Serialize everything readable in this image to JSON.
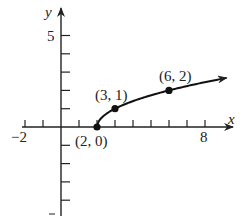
{
  "chart_data": {
    "type": "line",
    "title": "",
    "xlabel": "x",
    "ylabel": "y",
    "function": "y = sqrt(x - 2)",
    "x_tick_labels": [
      "-2",
      "8"
    ],
    "y_tick_labels": [
      "5"
    ],
    "xlim": [
      -3.5,
      9.5
    ],
    "ylim": [
      -4.8,
      6.2
    ],
    "grid": false,
    "legend": "none",
    "series": [
      {
        "name": "sqrt(x-2)",
        "x": [
          2,
          2.25,
          3,
          4,
          5,
          6,
          7,
          8,
          9.2
        ],
        "y": [
          0,
          0.5,
          1,
          1.414,
          1.732,
          2,
          2.236,
          2.449,
          2.683
        ]
      }
    ],
    "labeled_points": [
      {
        "label": "(2, 0)",
        "x": 2,
        "y": 0
      },
      {
        "label": "(3, 1)",
        "x": 3,
        "y": 1
      },
      {
        "label": "(6, 2)",
        "x": 6,
        "y": 2
      }
    ]
  }
}
